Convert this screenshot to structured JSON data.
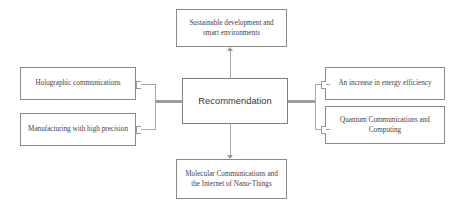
{
  "diagram": {
    "type": "hub-and-spoke",
    "title": "",
    "center": {
      "label": "Recommendation"
    },
    "nodes": [
      {
        "id": "sustainable-development",
        "label": "Sustainable development and smart environments",
        "position": "top"
      },
      {
        "id": "holographic-communications",
        "label": "Holographic communications",
        "position": "left-top"
      },
      {
        "id": "manufacturing-high-precision",
        "label": "Manufacturing with high precision",
        "position": "left-bottom"
      },
      {
        "id": "energy-efficiency",
        "label": "An increase in energy efficiency",
        "position": "right-top"
      },
      {
        "id": "quantum-communications",
        "label": "Quantum Communications and Computing",
        "position": "right-bottom"
      },
      {
        "id": "molecular-communications",
        "label": "Molecular Communications and the Internet of Nano-Things",
        "position": "bottom"
      }
    ],
    "colors": {
      "background": "#ffffff",
      "node_border": "#8a8a8a",
      "node_fill": "#ffffff",
      "edge": "#9a9a9a",
      "text": "#3f3f3f"
    }
  }
}
